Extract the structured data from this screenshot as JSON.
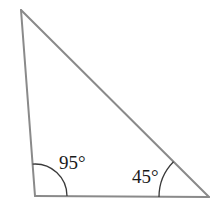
{
  "diagram": {
    "type": "triangle",
    "vertices": {
      "top": [
        21,
        10
      ],
      "bottom_left": [
        35,
        196
      ],
      "bottom_right": [
        209,
        197
      ]
    },
    "angles": [
      {
        "vertex": "bottom_left",
        "value": 95,
        "label": "95°"
      },
      {
        "vertex": "bottom_right",
        "value": 45,
        "label": "45°"
      }
    ],
    "colors": {
      "edge": "#8a8a8a",
      "arc": "#3a3a3a",
      "text": "#1a1a1a",
      "background": "#ffffff"
    }
  }
}
